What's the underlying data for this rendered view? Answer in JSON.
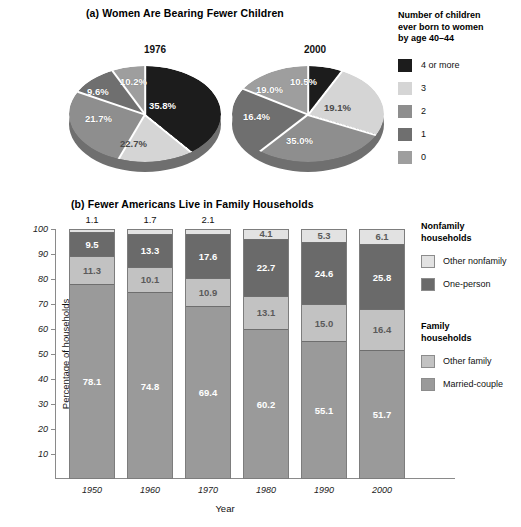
{
  "panel_a": {
    "title": "(a) Women Are Bearing Fewer Children",
    "pies": [
      {
        "year": "1976",
        "labels": [
          "35.8%",
          "22.7%",
          "21.7%",
          "9.6%",
          "10.2%"
        ]
      },
      {
        "year": "2000",
        "labels": [
          "10.5%",
          "19.1%",
          "35.0%",
          "16.4%",
          "19.0%"
        ]
      }
    ],
    "legend": {
      "title_line1": "Number of children",
      "title_line2": "ever born to women",
      "title_line3": "by age 40–44",
      "items": [
        {
          "label": "4 or more",
          "color": "#1c1c1c"
        },
        {
          "label": "3",
          "color": "#d5d5d5"
        },
        {
          "label": "2",
          "color": "#8e8e8e"
        },
        {
          "label": "1",
          "color": "#6f6f6f"
        },
        {
          "label": "0",
          "color": "#9e9e9e"
        }
      ]
    }
  },
  "panel_b": {
    "title": "(b) Fewer Americans Live in Family Households",
    "ylabel": "Percentage of households",
    "xlabel": "Year",
    "yticks": [
      "100",
      "90",
      "80",
      "70",
      "60",
      "50",
      "40",
      "30",
      "20",
      "10"
    ],
    "legend": {
      "group1_line1": "Nonfamily",
      "group1_line2": "households",
      "group1_items": [
        {
          "label": "Other nonfamily",
          "color": "#e2e2e2"
        },
        {
          "label": "One-person",
          "color": "#6a6a6a"
        }
      ],
      "group2_line1": "Family",
      "group2_line2": "households",
      "group2_items": [
        {
          "label": "Other family",
          "color": "#c2c2c2"
        },
        {
          "label": "Married-couple",
          "color": "#9a9a9a"
        }
      ]
    }
  },
  "chart_data": [
    {
      "type": "pie",
      "title": "(a) Women Are Bearing Fewer Children",
      "legend_title": "Number of children ever born to women by age 40–44",
      "legend_position": "right",
      "categories": [
        "4 or more",
        "3",
        "2",
        "1",
        "0"
      ],
      "colors": [
        "#1c1c1c",
        "#d5d5d5",
        "#8e8e8e",
        "#6f6f6f",
        "#9e9e9e"
      ],
      "series": [
        {
          "name": "1976",
          "values": [
            35.8,
            22.7,
            21.7,
            9.6,
            10.2
          ]
        },
        {
          "name": "2000",
          "values": [
            10.5,
            19.1,
            35.0,
            16.4,
            19.0
          ]
        }
      ]
    },
    {
      "type": "bar",
      "subtype": "stacked",
      "title": "(b) Fewer Americans Live in Family Households",
      "xlabel": "Year",
      "ylabel": "Percentage of households",
      "ylim": [
        0,
        100
      ],
      "yticks": [
        10,
        20,
        30,
        40,
        50,
        60,
        70,
        80,
        90,
        100
      ],
      "grid": false,
      "legend_position": "right",
      "categories": [
        "1950",
        "1960",
        "1970",
        "1980",
        "1990",
        "2000"
      ],
      "series": [
        {
          "name": "Married-couple",
          "color": "#9a9a9a",
          "values": [
            78.1,
            74.8,
            69.4,
            60.2,
            55.1,
            51.7
          ]
        },
        {
          "name": "Other family",
          "color": "#c2c2c2",
          "values": [
            11.3,
            10.1,
            10.9,
            13.1,
            15.0,
            16.4
          ]
        },
        {
          "name": "One-person",
          "color": "#6a6a6a",
          "values": [
            9.5,
            13.3,
            17.6,
            22.7,
            24.6,
            25.8
          ]
        },
        {
          "name": "Other nonfamily",
          "color": "#e2e2e2",
          "values": [
            1.1,
            1.7,
            2.1,
            4.1,
            5.3,
            6.1
          ]
        }
      ],
      "annotations": [
        {
          "text": "1.1",
          "position": "above-bar-1950"
        },
        {
          "text": "1.7",
          "position": "above-bar-1960"
        },
        {
          "text": "2.1",
          "position": "above-bar-1970"
        }
      ]
    }
  ]
}
